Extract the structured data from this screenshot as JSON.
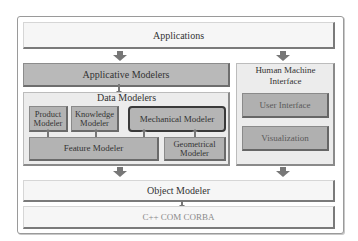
{
  "diagram": {
    "layers": {
      "applications": "Applications",
      "applicative_modelers": "Applicative Modelers",
      "data_modelers": {
        "title": "Data Modelers",
        "modules": {
          "product": [
            "Product",
            "Modeler"
          ],
          "knowledge": [
            "Knowledge",
            "Modeler"
          ],
          "mechanical": "Mechanical Modeler",
          "feature": "Feature Modeler",
          "geometrical": [
            "Geometrical",
            "Modeler"
          ]
        }
      },
      "hmi": {
        "title": [
          "Human Machine",
          "Interface"
        ],
        "user_interface": "User Interface",
        "visualization": "Visualization"
      },
      "object_modeler": "Object Modeler",
      "platform": "C++ COM CORBA"
    },
    "colors": {
      "light_box": "#f6f6f6",
      "grey_box": "#b9b9b9",
      "container": "#ececec",
      "arrow": "#777777",
      "mechanical_border": "#3a3a3a"
    }
  }
}
